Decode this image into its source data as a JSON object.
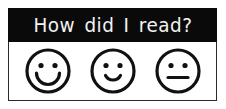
{
  "card": {
    "header": {
      "title": "How did I read?",
      "background_color": "#0a0a0a",
      "text_color": "#f2f2f2"
    },
    "border_color": "#2b2b2b",
    "background_color": "#ffffff"
  },
  "rating_options": [
    {
      "id": "happy",
      "icon": "smiley-face-happy-icon",
      "label": "Happy face",
      "mouth": "wide-deep-smile",
      "eyes": "round-dots",
      "stroke_color": "#111111"
    },
    {
      "id": "slightly-happy",
      "icon": "smiley-face-slight-smile-icon",
      "label": "Slightly happy face",
      "mouth": "small-shallow-smile",
      "eyes": "round-dots",
      "stroke_color": "#111111"
    },
    {
      "id": "neutral",
      "icon": "smiley-face-neutral-icon",
      "label": "Neutral face",
      "mouth": "straight-line",
      "eyes": "round-dots",
      "stroke_color": "#111111"
    }
  ]
}
